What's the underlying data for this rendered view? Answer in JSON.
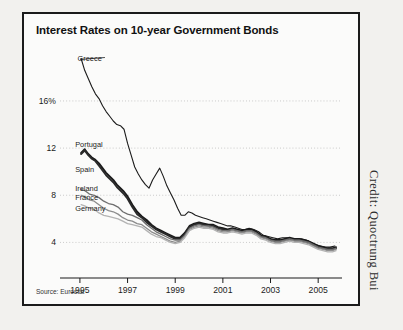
{
  "figure": {
    "title": "Interest Rates on 10-year Government Bonds",
    "source": "Source: Eurostat",
    "credit": "Credit: Quoctrung Bui"
  },
  "chart_data": {
    "type": "line",
    "title": "Interest Rates on 10-year Government Bonds",
    "xlabel": "",
    "ylabel": "",
    "ylim": [
      2,
      21
    ],
    "xlim": [
      1994.5,
      2006.0
    ],
    "grid": "horizontal-dotted",
    "legend": "inline-labels",
    "ytick_labels": [
      "16%",
      "12",
      "8",
      "4"
    ],
    "ytick_values": [
      16,
      12,
      8,
      4
    ],
    "xtick_labels": [
      "1995",
      "1997",
      "1999",
      "2001",
      "2003",
      "2005"
    ],
    "xtick_values": [
      1995,
      1997,
      1999,
      2001,
      2003,
      2005
    ],
    "source": "Source: Eurostat",
    "series": [
      {
        "name": "Greece",
        "color": "#1b1b1b",
        "width": 1.1,
        "label_x": 1994.9,
        "label_y": 19.6,
        "x": [
          1995.05,
          1995.2,
          1995.35,
          1995.5,
          1995.65,
          1995.8,
          1995.95,
          1996.1,
          1996.25,
          1996.4,
          1996.55,
          1996.7,
          1996.85,
          1997.0,
          1997.15,
          1997.3,
          1997.45,
          1997.6,
          1997.75,
          1997.9,
          1998.05,
          1998.2,
          1998.35,
          1998.5,
          1998.65,
          1998.8,
          1998.95,
          1999.1,
          1999.25,
          1999.4,
          1999.55,
          1999.7,
          1999.85,
          2000.0,
          2000.15,
          2000.3,
          2000.45,
          2000.6,
          2000.75,
          2000.9,
          2001.05,
          2001.2,
          2001.35,
          2001.5,
          2001.65,
          2001.8,
          2001.95,
          2002.1,
          2002.3,
          2002.5,
          2002.7,
          2002.9,
          2003.1,
          2003.3,
          2003.5,
          2003.7,
          2003.9,
          2004.1,
          2004.3,
          2004.5,
          2004.7,
          2004.9,
          2005.1,
          2005.3,
          2005.5,
          2005.7
        ],
        "y": [
          19.6,
          18.6,
          17.9,
          17.2,
          16.6,
          16.2,
          15.6,
          15.1,
          14.7,
          14.3,
          14.0,
          13.9,
          13.6,
          12.4,
          11.4,
          10.4,
          9.8,
          9.3,
          8.9,
          8.6,
          9.3,
          9.8,
          10.3,
          9.6,
          8.8,
          8.2,
          7.6,
          6.9,
          6.3,
          6.3,
          6.6,
          6.5,
          6.3,
          6.2,
          6.1,
          6.0,
          5.9,
          5.8,
          5.7,
          5.6,
          5.5,
          5.4,
          5.4,
          5.3,
          5.2,
          5.1,
          5.1,
          5.2,
          5.1,
          4.9,
          4.6,
          4.5,
          4.4,
          4.3,
          4.4,
          4.4,
          4.3,
          4.3,
          4.3,
          4.2,
          4.0,
          3.8,
          3.7,
          3.6,
          3.6,
          3.7
        ]
      },
      {
        "name": "Portugal",
        "color": "#1b1b1b",
        "width": 1.9,
        "label_x": 1994.8,
        "label_y": 12.3,
        "x": [
          1995.05,
          1995.2,
          1995.35,
          1995.5,
          1995.65,
          1995.8,
          1995.95,
          1996.1,
          1996.25,
          1996.4,
          1996.55,
          1996.7,
          1996.85,
          1997.0,
          1997.2,
          1997.4,
          1997.6,
          1997.8,
          1998.0,
          1998.2,
          1998.4,
          1998.6,
          1998.8,
          1999.0,
          1999.2,
          1999.4,
          1999.6,
          1999.8,
          2000.0,
          2000.2,
          2000.4,
          2000.6,
          2000.8,
          2001.0,
          2001.2,
          2001.4,
          2001.6,
          2001.8,
          2002.0,
          2002.2,
          2002.4,
          2002.6,
          2002.8,
          2003.0,
          2003.2,
          2003.4,
          2003.6,
          2003.8,
          2004.0,
          2004.2,
          2004.4,
          2004.6,
          2004.8,
          2005.0,
          2005.2,
          2005.4,
          2005.6,
          2005.75
        ],
        "y": [
          11.6,
          11.9,
          11.5,
          11.2,
          11.0,
          10.7,
          10.3,
          9.9,
          9.6,
          9.3,
          8.9,
          8.6,
          8.3,
          7.9,
          7.2,
          6.6,
          6.2,
          5.9,
          5.5,
          5.2,
          5.0,
          4.8,
          4.6,
          4.4,
          4.4,
          4.8,
          5.4,
          5.6,
          5.7,
          5.6,
          5.5,
          5.5,
          5.3,
          5.2,
          5.1,
          5.2,
          5.1,
          5.0,
          5.1,
          5.1,
          4.9,
          4.6,
          4.5,
          4.3,
          4.2,
          4.2,
          4.3,
          4.4,
          4.3,
          4.3,
          4.2,
          4.1,
          3.9,
          3.7,
          3.6,
          3.5,
          3.5,
          3.6
        ]
      },
      {
        "name": "Spain",
        "color": "#2a2a2a",
        "width": 1.9,
        "label_x": 1994.8,
        "label_y": 10.2,
        "x": [
          1995.05,
          1995.2,
          1995.35,
          1995.5,
          1995.65,
          1995.8,
          1995.95,
          1996.1,
          1996.25,
          1996.4,
          1996.55,
          1996.7,
          1996.85,
          1997.0,
          1997.2,
          1997.4,
          1997.6,
          1997.8,
          1998.0,
          1998.2,
          1998.4,
          1998.6,
          1998.8,
          1999.0,
          1999.2,
          1999.4,
          1999.6,
          1999.8,
          2000.0,
          2000.2,
          2000.4,
          2000.6,
          2000.8,
          2001.0,
          2001.2,
          2001.4,
          2001.6,
          2001.8,
          2002.0,
          2002.2,
          2002.4,
          2002.6,
          2002.8,
          2003.0,
          2003.2,
          2003.4,
          2003.6,
          2003.8,
          2004.0,
          2004.2,
          2004.4,
          2004.6,
          2004.8,
          2005.0,
          2005.2,
          2005.4,
          2005.6,
          2005.75
        ],
        "y": [
          11.5,
          11.8,
          11.4,
          11.1,
          10.9,
          10.5,
          10.1,
          9.7,
          9.4,
          9.1,
          8.7,
          8.4,
          8.1,
          7.7,
          7.0,
          6.4,
          6.1,
          5.7,
          5.4,
          5.1,
          4.9,
          4.7,
          4.5,
          4.3,
          4.3,
          4.7,
          5.3,
          5.5,
          5.6,
          5.5,
          5.4,
          5.4,
          5.2,
          5.1,
          5.0,
          5.1,
          5.0,
          4.9,
          5.0,
          5.0,
          4.8,
          4.5,
          4.4,
          4.2,
          4.1,
          4.1,
          4.2,
          4.3,
          4.2,
          4.2,
          4.1,
          4.0,
          3.8,
          3.6,
          3.5,
          3.4,
          3.4,
          3.5
        ]
      },
      {
        "name": "Ireland",
        "color": "#6e6e6e",
        "width": 1.3,
        "label_x": 1994.8,
        "label_y": 8.6,
        "x": [
          1995.05,
          1995.2,
          1995.4,
          1995.6,
          1995.8,
          1996.0,
          1996.2,
          1996.4,
          1996.6,
          1996.8,
          1997.0,
          1997.2,
          1997.4,
          1997.6,
          1997.8,
          1998.0,
          1998.2,
          1998.4,
          1998.6,
          1998.8,
          1999.0,
          1999.2,
          1999.4,
          1999.6,
          1999.8,
          2000.0,
          2000.2,
          2000.4,
          2000.6,
          2000.8,
          2001.0,
          2001.2,
          2001.4,
          2001.6,
          2001.8,
          2002.0,
          2002.2,
          2002.4,
          2002.6,
          2002.8,
          2003.0,
          2003.2,
          2003.4,
          2003.6,
          2003.8,
          2004.0,
          2004.2,
          2004.4,
          2004.6,
          2004.8,
          2005.0,
          2005.2,
          2005.4,
          2005.6,
          2005.75
        ],
        "y": [
          8.5,
          8.4,
          8.1,
          8.0,
          7.8,
          7.5,
          7.3,
          7.2,
          7.0,
          6.6,
          6.4,
          6.3,
          6.1,
          5.9,
          5.5,
          5.2,
          4.9,
          4.7,
          4.5,
          4.3,
          4.2,
          4.2,
          4.6,
          5.2,
          5.4,
          5.5,
          5.4,
          5.4,
          5.3,
          5.1,
          5.0,
          5.0,
          5.1,
          5.0,
          4.9,
          5.0,
          5.0,
          4.8,
          4.5,
          4.4,
          4.2,
          4.1,
          4.1,
          4.2,
          4.3,
          4.2,
          4.2,
          4.1,
          4.0,
          3.8,
          3.6,
          3.5,
          3.4,
          3.4,
          3.5
        ]
      },
      {
        "name": "France",
        "color": "#8c8c8c",
        "width": 1.3,
        "label_x": 1994.8,
        "label_y": 7.8,
        "x": [
          1995.05,
          1995.2,
          1995.4,
          1995.6,
          1995.8,
          1996.0,
          1996.2,
          1996.4,
          1996.6,
          1996.8,
          1997.0,
          1997.2,
          1997.4,
          1997.6,
          1997.8,
          1998.0,
          1998.2,
          1998.4,
          1998.6,
          1998.8,
          1999.0,
          1999.2,
          1999.4,
          1999.6,
          1999.8,
          2000.0,
          2000.2,
          2000.4,
          2000.6,
          2000.8,
          2001.0,
          2001.2,
          2001.4,
          2001.6,
          2001.8,
          2002.0,
          2002.2,
          2002.4,
          2002.6,
          2002.8,
          2003.0,
          2003.2,
          2003.4,
          2003.6,
          2003.8,
          2004.0,
          2004.2,
          2004.4,
          2004.6,
          2004.8,
          2005.0,
          2005.2,
          2005.4,
          2005.6,
          2005.75
        ],
        "y": [
          8.0,
          7.9,
          7.6,
          7.5,
          7.2,
          6.9,
          6.7,
          6.6,
          6.4,
          6.1,
          5.9,
          5.8,
          5.6,
          5.5,
          5.2,
          4.9,
          4.7,
          4.5,
          4.3,
          4.1,
          4.0,
          4.1,
          4.5,
          5.1,
          5.3,
          5.4,
          5.3,
          5.3,
          5.2,
          5.0,
          4.9,
          4.9,
          5.0,
          4.9,
          4.8,
          4.9,
          4.9,
          4.7,
          4.4,
          4.3,
          4.1,
          4.0,
          4.0,
          4.1,
          4.2,
          4.1,
          4.1,
          4.0,
          3.9,
          3.7,
          3.5,
          3.4,
          3.3,
          3.3,
          3.4
        ]
      },
      {
        "name": "Germany",
        "color": "#b3b3b3",
        "width": 1.3,
        "label_x": 1994.8,
        "label_y": 6.9,
        "x": [
          1995.05,
          1995.2,
          1995.4,
          1995.6,
          1995.8,
          1996.0,
          1996.2,
          1996.4,
          1996.6,
          1996.8,
          1997.0,
          1997.2,
          1997.4,
          1997.6,
          1997.8,
          1998.0,
          1998.2,
          1998.4,
          1998.6,
          1998.8,
          1999.0,
          1999.2,
          1999.4,
          1999.6,
          1999.8,
          2000.0,
          2000.2,
          2000.4,
          2000.6,
          2000.8,
          2001.0,
          2001.2,
          2001.4,
          2001.6,
          2001.8,
          2002.0,
          2002.2,
          2002.4,
          2002.6,
          2002.8,
          2003.0,
          2003.2,
          2003.4,
          2003.6,
          2003.8,
          2004.0,
          2004.2,
          2004.4,
          2004.6,
          2004.8,
          2005.0,
          2005.2,
          2005.4,
          2005.6,
          2005.75
        ],
        "y": [
          7.2,
          7.1,
          6.9,
          6.8,
          6.5,
          6.3,
          6.2,
          6.1,
          6.0,
          5.8,
          5.6,
          5.5,
          5.4,
          5.3,
          5.0,
          4.7,
          4.5,
          4.4,
          4.2,
          4.0,
          3.9,
          4.0,
          4.4,
          5.0,
          5.2,
          5.3,
          5.2,
          5.2,
          5.1,
          4.9,
          4.8,
          4.8,
          4.9,
          4.8,
          4.7,
          4.8,
          4.8,
          4.6,
          4.3,
          4.2,
          4.0,
          3.9,
          3.9,
          4.0,
          4.1,
          4.0,
          4.0,
          3.9,
          3.8,
          3.6,
          3.4,
          3.3,
          3.2,
          3.2,
          3.3
        ]
      }
    ]
  }
}
